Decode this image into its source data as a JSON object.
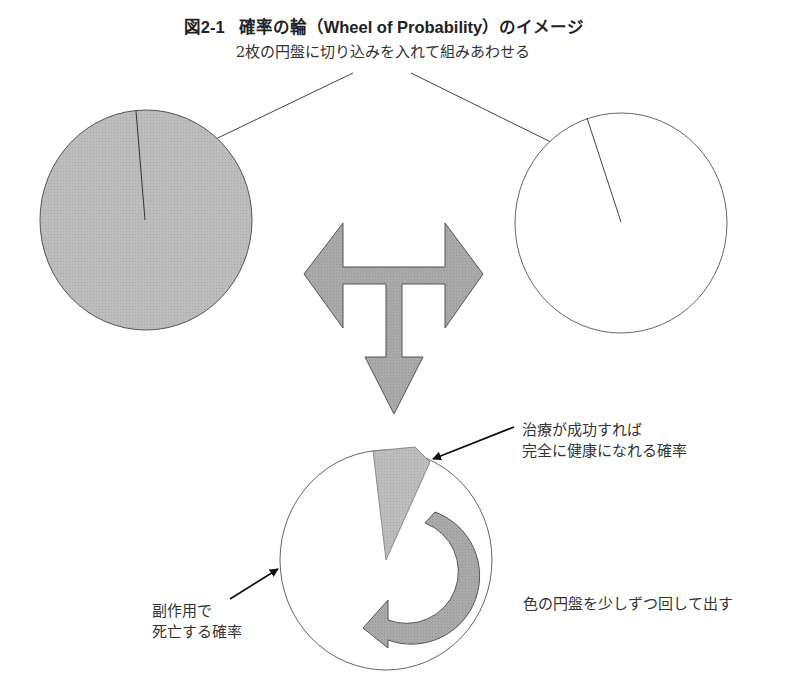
{
  "figure": {
    "number": "図2-1",
    "title": "確率の輪（Wheel of Probability）のイメージ",
    "subtitle": "2枚の円盤に切り込みを入れて組みあわせる"
  },
  "disks": {
    "colored_disk": {
      "fill": "#bdbdbd",
      "stroke": "#555555",
      "description": "gray disk with radial cut"
    },
    "white_disk": {
      "fill": "#ffffff",
      "stroke": "#666666",
      "description": "white disk with radial cut"
    },
    "combined_disk": {
      "fill": "#ffffff",
      "stroke": "#666666",
      "wedge_fill": "#bdbdbd"
    }
  },
  "arrows": {
    "t_arrow": {
      "fill": "#a9a9a9",
      "stroke": "#555555",
      "directions": [
        "left",
        "right",
        "down"
      ]
    },
    "rotate_arrow": {
      "fill": "#a9a9a9",
      "stroke": "#555555",
      "direction": "clockwise"
    }
  },
  "labels": {
    "success_line1": "治療が成功すれば",
    "success_line2": "完全に健康になれる確率",
    "death_line1": "副作用で",
    "death_line2": "死亡する確率",
    "rotate": "色の円盤を少しずつ回して出す"
  },
  "colors": {
    "text": "#333333",
    "gray_fill": "#bdbdbd",
    "arrow_fill": "#a9a9a9",
    "line": "#444444"
  }
}
